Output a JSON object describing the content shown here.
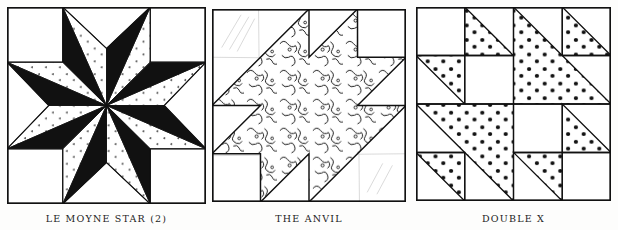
{
  "page": {
    "background": "#fdfdfc",
    "ink": "#111111"
  },
  "blocks": [
    {
      "id": "lemoyne-star",
      "label": "LE MOYNE STAR (2)",
      "pattern_fabric": "small-dot print",
      "solid_fabric": "black"
    },
    {
      "id": "the-anvil",
      "label": "THE ANVIL",
      "pattern_fabric": "squiggle print"
    },
    {
      "id": "double-x",
      "label": "DOUBLE X",
      "pattern_fabric": "large-dot print"
    }
  ]
}
